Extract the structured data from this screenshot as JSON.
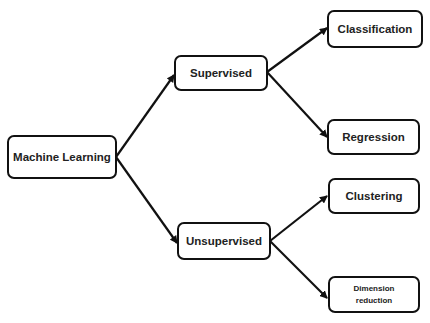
{
  "diagram": {
    "type": "tree",
    "nodes": [
      {
        "id": "ml",
        "label": "Machine Learning"
      },
      {
        "id": "sup",
        "label": "Supervised"
      },
      {
        "id": "unsup",
        "label": "Unsupervised"
      },
      {
        "id": "cls",
        "label": "Classification"
      },
      {
        "id": "reg",
        "label": "Regression"
      },
      {
        "id": "clu",
        "label": "Clustering"
      },
      {
        "id": "dim",
        "label": "Dimension reduction",
        "lines": [
          "Dimension",
          "reduction"
        ]
      }
    ],
    "edges": [
      {
        "from": "ml",
        "to": "sup"
      },
      {
        "from": "ml",
        "to": "unsup"
      },
      {
        "from": "sup",
        "to": "cls"
      },
      {
        "from": "sup",
        "to": "reg"
      },
      {
        "from": "unsup",
        "to": "clu"
      },
      {
        "from": "unsup",
        "to": "dim"
      }
    ]
  }
}
